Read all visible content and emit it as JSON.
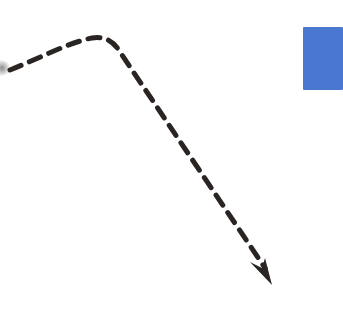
{
  "diagram": {
    "background": "#ffffff",
    "path": {
      "stroke_color": "#2a2522",
      "stroke_width": 5,
      "dash": "12 9",
      "d": "M 10 70 C 40 58, 70 42, 92 38 C 106 36, 114 42, 120 52 L 265 268"
    },
    "arrowhead": {
      "color": "#2a2522",
      "points": "250,262 272,285 265,258 262,268"
    },
    "block": {
      "color": "#4a78d0"
    }
  }
}
